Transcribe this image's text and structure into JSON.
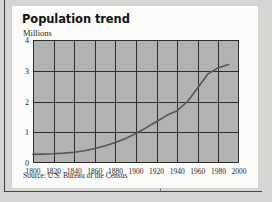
{
  "chart_data": {
    "type": "line",
    "title": "Population trend",
    "ylabel": "Millions",
    "xlabel": "",
    "source": "Source: U.S. Bureau of the Census",
    "grid": true,
    "legend": false,
    "xlim": [
      1800,
      2000
    ],
    "ylim": [
      0,
      4
    ],
    "x_ticks": [
      "1800",
      "1820",
      "1840",
      "1860",
      "1880",
      "1900",
      "1920",
      "1940",
      "1960",
      "1980",
      "2000"
    ],
    "y_ticks": [
      "0",
      "1",
      "2",
      "3",
      "4"
    ],
    "series": [
      {
        "name": "Population",
        "x": [
          1800,
          1810,
          1820,
          1830,
          1840,
          1850,
          1860,
          1870,
          1880,
          1890,
          1900,
          1910,
          1920,
          1930,
          1940,
          1950,
          1960,
          1970,
          1980,
          1990
        ],
        "values": [
          0.28,
          0.29,
          0.3,
          0.32,
          0.35,
          0.4,
          0.47,
          0.56,
          0.67,
          0.8,
          0.96,
          1.15,
          1.35,
          1.55,
          1.7,
          2.0,
          2.45,
          2.9,
          3.1,
          3.2
        ]
      }
    ],
    "line_color": "#555552",
    "plot_background": "#b2b2b0",
    "grid_color": "#2e2e2c"
  },
  "page": {
    "background": "#d6d6d4",
    "card_background": "#fbfbf9"
  }
}
